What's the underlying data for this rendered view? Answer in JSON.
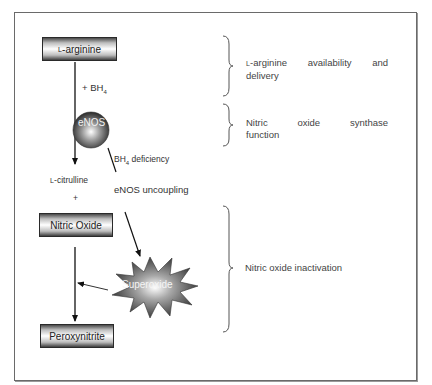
{
  "diagram": {
    "nodes": {
      "l_arginine": {
        "prefix": "L",
        "label": "-arginine"
      },
      "enos": {
        "label": "eNOS"
      },
      "l_citrulline": {
        "prefix": "L",
        "label": "-citrulline"
      },
      "plus": "+",
      "nitric_oxide": {
        "label": "Nitric Oxide"
      },
      "superoxide": {
        "label": "Superoxide"
      },
      "peroxynitrite": {
        "label": "Peroxynitrite"
      }
    },
    "edge_labels": {
      "bh4_cofactor": {
        "text": "+ BH",
        "sub": "4"
      },
      "bh4_deficiency": {
        "text": "BH",
        "sub": "4",
        "suffix": " deficiency"
      },
      "enos_uncoupling": "eNOS uncoupling"
    },
    "annotations": [
      {
        "prefix": "L",
        "line1": "-arginine availability and",
        "line2": "delivery"
      },
      {
        "line1": "Nitric oxide synthase",
        "line2": "function"
      },
      {
        "line1": "Nitric oxide inactivation"
      }
    ]
  }
}
